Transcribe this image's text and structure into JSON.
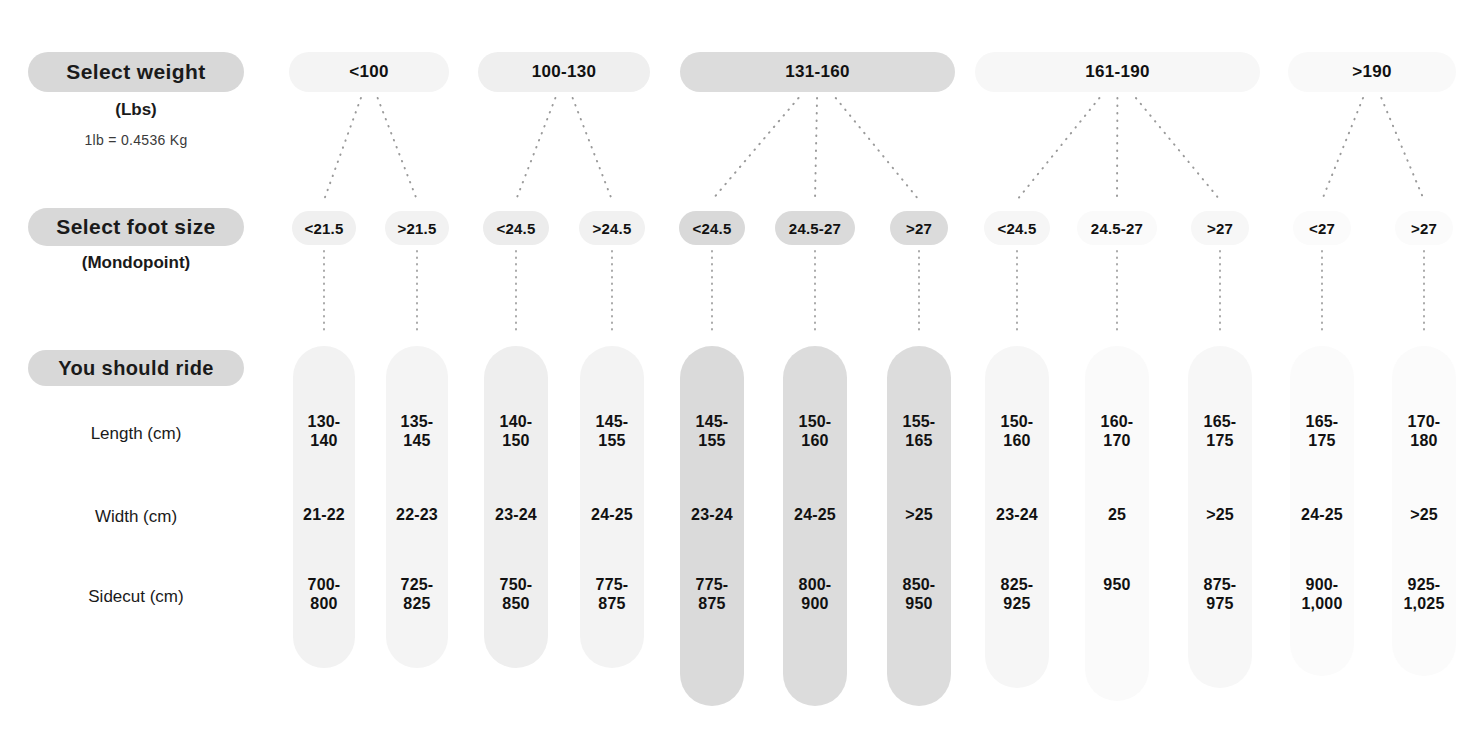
{
  "title": "",
  "labels": {
    "select_weight": "Select weight",
    "weight_unit": "(Lbs)",
    "weight_conversion": "1lb = 0.4536 Kg",
    "select_foot_size": "Select foot size",
    "foot_unit": "(Mondopoint)",
    "you_should_ride": "You should ride",
    "row_length": "Length (cm)",
    "row_width": "Width (cm)",
    "row_sidecut": "Sidecut (cm)"
  },
  "chart_data": {
    "type": "table",
    "xlabel": "Select weight (Lbs) / Select foot size (Mondopoint)",
    "ylabel": "You should ride",
    "grid": false,
    "legend": "none",
    "row_headers": [
      "Length (cm)",
      "Width (cm)",
      "Sidecut (cm)"
    ],
    "weight_groups": [
      {
        "label": "<100",
        "x": 289,
        "width": 160,
        "shade": "#f4f4f4",
        "foot_span": [
          0,
          1
        ]
      },
      {
        "label": "100-130",
        "x": 478,
        "width": 172,
        "shade": "#efefef",
        "foot_span": [
          2,
          3
        ]
      },
      {
        "label": "131-160",
        "x": 680,
        "width": 275,
        "shade": "#dcdcdc",
        "foot_span": [
          4,
          6
        ]
      },
      {
        "label": "161-190",
        "x": 975,
        "width": 285,
        "shade": "#f7f7f7",
        "foot_span": [
          7,
          9
        ]
      },
      {
        "label": ">190",
        "x": 1288,
        "width": 168,
        "shade": "#f9f9f9",
        "foot_span": [
          10,
          11
        ]
      }
    ],
    "columns": [
      {
        "foot_size": "<21.5",
        "center": 324,
        "pill_w": 64,
        "board_w": 62,
        "board_h": 322,
        "shade": "#f2f2f2",
        "pill_shade": "#f0f0f0",
        "length": "130-\n140",
        "width": "21-22",
        "sidecut": "700-\n800"
      },
      {
        "foot_size": ">21.5",
        "center": 417,
        "pill_w": 64,
        "board_w": 62,
        "board_h": 322,
        "shade": "#f4f4f4",
        "pill_shade": "#f2f2f2",
        "length": "135-\n145",
        "width": "22-23",
        "sidecut": "725-\n825"
      },
      {
        "foot_size": "<24.5",
        "center": 516,
        "pill_w": 66,
        "board_w": 64,
        "board_h": 322,
        "shade": "#eeeeee",
        "pill_shade": "#ececec",
        "length": "140-\n150",
        "width": "23-24",
        "sidecut": "750-\n850"
      },
      {
        "foot_size": ">24.5",
        "center": 612,
        "pill_w": 66,
        "board_w": 64,
        "board_h": 322,
        "shade": "#f3f3f3",
        "pill_shade": "#f1f1f1",
        "length": "145-\n155",
        "width": "24-25",
        "sidecut": "775-\n875"
      },
      {
        "foot_size": "<24.5",
        "center": 712,
        "pill_w": 66,
        "board_w": 64,
        "board_h": 360,
        "shade": "#dadada",
        "pill_shade": "#d9d9d9",
        "length": "145-\n155",
        "width": "23-24",
        "sidecut": "775-\n875"
      },
      {
        "foot_size": "24.5-27",
        "center": 815,
        "pill_w": 80,
        "board_w": 64,
        "board_h": 360,
        "shade": "#dcdcdc",
        "pill_shade": "#dadada",
        "length": "150-\n160",
        "width": "24-25",
        "sidecut": "800-\n900"
      },
      {
        "foot_size": ">27",
        "center": 919,
        "pill_w": 58,
        "board_w": 64,
        "board_h": 360,
        "shade": "#dcdcdc",
        "pill_shade": "#dbdbdb",
        "length": "155-\n165",
        "width": ">25",
        "sidecut": "850-\n950"
      },
      {
        "foot_size": "<24.5",
        "center": 1017,
        "pill_w": 66,
        "board_w": 64,
        "board_h": 342,
        "shade": "#f6f6f6",
        "pill_shade": "#f6f6f6",
        "length": "150-\n160",
        "width": "23-24",
        "sidecut": "825-\n925"
      },
      {
        "foot_size": "24.5-27",
        "center": 1117,
        "pill_w": 80,
        "board_w": 64,
        "board_h": 355,
        "shade": "#fafafa",
        "pill_shade": "#fafafa",
        "length": "160-\n170",
        "width": "25",
        "sidecut": "950"
      },
      {
        "foot_size": ">27",
        "center": 1220,
        "pill_w": 58,
        "board_w": 64,
        "board_h": 342,
        "shade": "#f7f7f7",
        "pill_shade": "#f7f7f7",
        "length": "165-\n175",
        "width": ">25",
        "sidecut": "875-\n975"
      },
      {
        "foot_size": "<27",
        "center": 1322,
        "pill_w": 58,
        "board_w": 64,
        "board_h": 330,
        "shade": "#fbfbfb",
        "pill_shade": "#fbfbfb",
        "length": "165-\n175",
        "width": "24-25",
        "sidecut": "900-\n1,000"
      },
      {
        "foot_size": ">27",
        "center": 1424,
        "pill_w": 58,
        "board_w": 64,
        "board_h": 330,
        "shade": "#fbfbfb",
        "pill_shade": "#fbfbfb",
        "length": "170-\n180",
        "width": ">25",
        "sidecut": "925-\n1,025"
      }
    ]
  },
  "geometry": {
    "weight_pill_top": 52,
    "foot_pill_top": 211,
    "board_top": 346,
    "row_length_y": 412,
    "row_width_y": 505,
    "row_sidecut_y": 575
  }
}
